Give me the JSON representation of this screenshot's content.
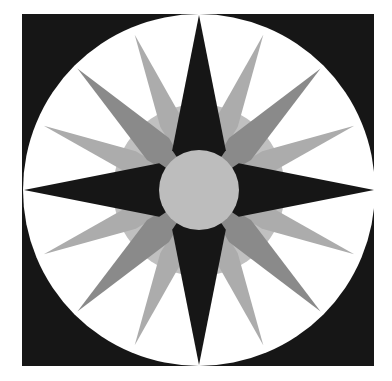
{
  "image": {
    "description": "Compass rose quilt block: black square with white circle containing a 16-point star",
    "canvas": {
      "width": 392,
      "height": 381,
      "background": "#ffffff"
    },
    "square": {
      "x": 22,
      "y": 14,
      "width": 352,
      "height": 352,
      "color": "#161616"
    },
    "circle": {
      "cx": 199,
      "cy": 190,
      "r": 176,
      "color": "#ffffff"
    },
    "ring": {
      "r": 86,
      "color": "#c0c0c0"
    },
    "center_disc": {
      "r": 40,
      "color": "#bdbdbd"
    },
    "points": {
      "cardinal": {
        "count": 4,
        "tip_r": 175,
        "base_r": 48,
        "half_angle_deg": 34,
        "color": "#161616"
      },
      "diagonal": {
        "count": 4,
        "tip_r": 172,
        "base_r": 60,
        "half_angle_deg": 15,
        "color": "#8a8a8a"
      },
      "secondary": {
        "count": 8,
        "tip_r": 168,
        "base_r": 74,
        "half_angle_deg": 9,
        "color": "#acacac"
      }
    }
  }
}
